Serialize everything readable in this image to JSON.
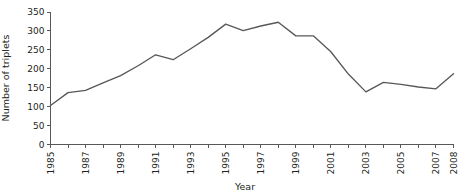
{
  "chart_data": {
    "type": "line",
    "title": "",
    "xlabel": "Year",
    "ylabel": "Number of triplets",
    "xlim": [
      1985,
      2008
    ],
    "ylim": [
      0,
      350
    ],
    "grid": false,
    "legend": null,
    "x_tick_labels": [
      "1985",
      "1987",
      "1989",
      "1991",
      "1993",
      "1995",
      "1997",
      "1999",
      "2001",
      "2003",
      "2005",
      "2007",
      "2008"
    ],
    "x_tick_values": [
      1985,
      1987,
      1989,
      1991,
      1993,
      1995,
      1997,
      1999,
      2001,
      2003,
      2005,
      2007,
      2008
    ],
    "x_minor_ticks": [
      1986,
      1988,
      1990,
      1992,
      1994,
      1996,
      1998,
      2000,
      2002,
      2004,
      2006
    ],
    "y_tick_labels": [
      "0",
      "50",
      "100",
      "150",
      "200",
      "250",
      "300",
      "350"
    ],
    "y_tick_values": [
      0,
      50,
      100,
      150,
      200,
      250,
      300,
      350
    ],
    "x": [
      1985,
      1986,
      1987,
      1988,
      1989,
      1990,
      1991,
      1992,
      1993,
      1994,
      1995,
      1996,
      1997,
      1998,
      1999,
      2000,
      2001,
      2002,
      2003,
      2004,
      2005,
      2006,
      2007,
      2008
    ],
    "values": [
      103,
      137,
      143,
      163,
      182,
      208,
      237,
      224,
      253,
      283,
      318,
      301,
      313,
      323,
      287,
      287,
      245,
      186,
      139,
      164,
      159,
      152,
      147,
      187
    ],
    "series": [
      {
        "name": "Number of triplets",
        "color": "#58585b",
        "values": [
          103,
          137,
          143,
          163,
          182,
          208,
          237,
          224,
          253,
          283,
          318,
          301,
          313,
          323,
          287,
          287,
          245,
          186,
          139,
          164,
          159,
          152,
          147,
          187
        ]
      }
    ]
  },
  "axes": {
    "y_label": "Number of triplets",
    "x_label": "Year"
  }
}
